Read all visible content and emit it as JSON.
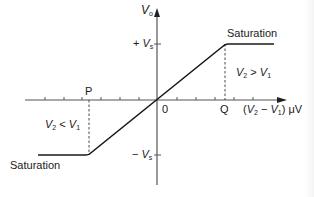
{
  "diagram": {
    "y_axis": {
      "symbol": "V",
      "subscript": "o"
    },
    "x_axis": {
      "expr_open": "(",
      "v2": "V",
      "v2_sub": "2",
      "minus": " − ",
      "v1": "V",
      "v1_sub": "1",
      "expr_close": ") ",
      "unit": "μV"
    },
    "origin_label": "0",
    "pos_sat": {
      "sign": "+",
      "symbol": "V",
      "subscript": "s"
    },
    "neg_sat": {
      "sign": "−",
      "symbol": "V",
      "subscript": "s"
    },
    "point_p": "P",
    "point_q": "Q",
    "saturation_upper": "Saturation",
    "saturation_lower": "Saturation",
    "cond_upper": {
      "a": "V",
      "a_sub": "2",
      "op": " > ",
      "b": "V",
      "b_sub": "1"
    },
    "cond_lower": {
      "a": "V",
      "a_sub": "2",
      "op": " < ",
      "b": "V",
      "b_sub": "1"
    },
    "colors": {
      "axis": "#555555",
      "curve": "#1a1a1a",
      "text": "#1a1a1a"
    }
  }
}
